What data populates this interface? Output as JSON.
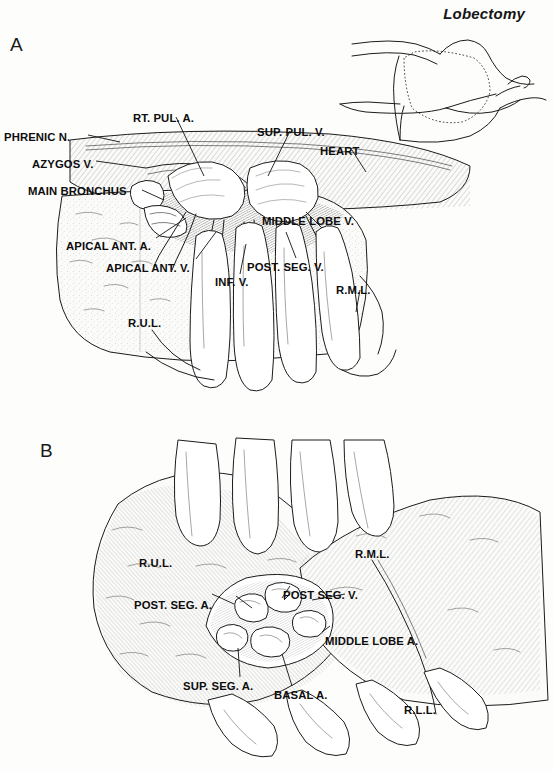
{
  "page": {
    "running_head": "Lobectomy",
    "background_color": "#fdfdfc",
    "ink_color": "#1b1b1b"
  },
  "figure": {
    "type": "medical-illustration",
    "style": "pen-and-ink line drawing with cross-hatch shading",
    "panels": [
      {
        "id": "A",
        "letter": "A",
        "caption_position": "top-left",
        "description": "Anterior hilar dissection of the right lung with surgeon's hand retracting the lung; mediastinal structures exposed",
        "inset": {
          "present": true,
          "description": "small orientation drawing of patient in lateral decubitus position with dotted thoracotomy incision"
        },
        "labels": [
          {
            "text": "PHRENIC N.",
            "x": 4,
            "y": 132,
            "anchor": "left"
          },
          {
            "text": "AZYGOS V.",
            "x": 32,
            "y": 159,
            "anchor": "left"
          },
          {
            "text": "MAIN BRONCHUS",
            "x": 28,
            "y": 186,
            "anchor": "left"
          },
          {
            "text": "RT. PUL. A.",
            "x": 133,
            "y": 113,
            "anchor": "left"
          },
          {
            "text": "SUP. PUL. V.",
            "x": 257,
            "y": 127,
            "anchor": "left"
          },
          {
            "text": "HEART",
            "x": 320,
            "y": 146,
            "anchor": "left"
          },
          {
            "text": "MIDDLE LOBE V.",
            "x": 262,
            "y": 216,
            "anchor": "left"
          },
          {
            "text": "APICAL ANT. A.",
            "x": 66,
            "y": 241,
            "anchor": "left"
          },
          {
            "text": "APICAL ANT. V.",
            "x": 106,
            "y": 263,
            "anchor": "left"
          },
          {
            "text": "INF. V.",
            "x": 215,
            "y": 277,
            "anchor": "left"
          },
          {
            "text": "POST. SEG. V.",
            "x": 247,
            "y": 262,
            "anchor": "left"
          },
          {
            "text": "R.M.L.",
            "x": 336,
            "y": 285,
            "anchor": "left"
          },
          {
            "text": "R.U.L.",
            "x": 128,
            "y": 318,
            "anchor": "left"
          }
        ]
      },
      {
        "id": "B",
        "letter": "B",
        "caption_position": "top-left",
        "description": "Posterior view of the oblique fissure opened, segmental pulmonary arteries exposed, fingers retracting the lobes",
        "labels": [
          {
            "text": "R.U.L.",
            "x": 139,
            "y": 558,
            "anchor": "left"
          },
          {
            "text": "R.M.L.",
            "x": 355,
            "y": 549,
            "anchor": "left"
          },
          {
            "text": "POST SEG. V.",
            "x": 283,
            "y": 590,
            "anchor": "left"
          },
          {
            "text": "POST. SEG. A.",
            "x": 134,
            "y": 600,
            "anchor": "left"
          },
          {
            "text": "MIDDLE LOBE A.",
            "x": 325,
            "y": 636,
            "anchor": "left"
          },
          {
            "text": "SUP. SEG. A.",
            "x": 183,
            "y": 681,
            "anchor": "left"
          },
          {
            "text": "BASAL A.",
            "x": 274,
            "y": 690,
            "anchor": "left"
          },
          {
            "text": "R.L.L.",
            "x": 404,
            "y": 705,
            "anchor": "left"
          }
        ]
      }
    ],
    "abbreviations": {
      "R.U.L.": "right upper lobe",
      "R.M.L.": "right middle lobe",
      "R.L.L.": "right lower lobe",
      "A.": "artery",
      "V.": "vein",
      "N.": "nerve",
      "SUP.": "superior",
      "INF.": "inferior",
      "ANT.": "anterior",
      "POST.": "posterior",
      "SEG.": "segmental",
      "PUL.": "pulmonary",
      "RT.": "right"
    }
  }
}
